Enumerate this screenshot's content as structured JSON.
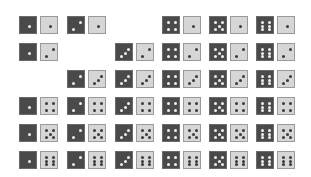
{
  "diagram": {
    "colors": {
      "dark_die": "#4a4a4a",
      "light_die": "#d6d6d6",
      "dark_pip": "#f0f0f0",
      "light_pip": "#3a3a3a"
    },
    "columns_x": [
      19,
      67,
      115,
      162,
      209,
      256
    ],
    "rows_y": [
      16,
      43,
      70,
      97,
      124,
      151
    ],
    "light_offset_x": 21,
    "die_size": 18,
    "pairs": [
      {
        "row": 1,
        "col": 1,
        "dark": 1,
        "light": 1
      },
      {
        "row": 1,
        "col": 2,
        "dark": 2,
        "light": 1
      },
      {
        "row": 1,
        "col": 4,
        "dark": 4,
        "light": 1
      },
      {
        "row": 1,
        "col": 5,
        "dark": 5,
        "light": 1
      },
      {
        "row": 1,
        "col": 6,
        "dark": 6,
        "light": 1
      },
      {
        "row": 2,
        "col": 1,
        "dark": 1,
        "light": 2
      },
      {
        "row": 2,
        "col": 3,
        "dark": 3,
        "light": 2
      },
      {
        "row": 2,
        "col": 4,
        "dark": 4,
        "light": 2
      },
      {
        "row": 2,
        "col": 5,
        "dark": 5,
        "light": 2
      },
      {
        "row": 2,
        "col": 6,
        "dark": 6,
        "light": 2
      },
      {
        "row": 3,
        "col": 2,
        "dark": 2,
        "light": 3
      },
      {
        "row": 3,
        "col": 3,
        "dark": 3,
        "light": 3
      },
      {
        "row": 3,
        "col": 4,
        "dark": 4,
        "light": 3
      },
      {
        "row": 3,
        "col": 5,
        "dark": 5,
        "light": 3
      },
      {
        "row": 3,
        "col": 6,
        "dark": 6,
        "light": 3
      },
      {
        "row": 4,
        "col": 1,
        "dark": 1,
        "light": 4
      },
      {
        "row": 4,
        "col": 2,
        "dark": 2,
        "light": 4
      },
      {
        "row": 4,
        "col": 3,
        "dark": 3,
        "light": 4
      },
      {
        "row": 4,
        "col": 4,
        "dark": 4,
        "light": 4
      },
      {
        "row": 4,
        "col": 5,
        "dark": 5,
        "light": 4
      },
      {
        "row": 4,
        "col": 6,
        "dark": 6,
        "light": 4
      },
      {
        "row": 5,
        "col": 1,
        "dark": 1,
        "light": 5
      },
      {
        "row": 5,
        "col": 2,
        "dark": 2,
        "light": 5
      },
      {
        "row": 5,
        "col": 3,
        "dark": 3,
        "light": 5
      },
      {
        "row": 5,
        "col": 4,
        "dark": 4,
        "light": 5
      },
      {
        "row": 5,
        "col": 5,
        "dark": 5,
        "light": 5
      },
      {
        "row": 5,
        "col": 6,
        "dark": 6,
        "light": 5
      },
      {
        "row": 6,
        "col": 1,
        "dark": 1,
        "light": 6
      },
      {
        "row": 6,
        "col": 2,
        "dark": 2,
        "light": 6
      },
      {
        "row": 6,
        "col": 3,
        "dark": 3,
        "light": 6
      },
      {
        "row": 6,
        "col": 4,
        "dark": 4,
        "light": 6
      },
      {
        "row": 6,
        "col": 5,
        "dark": 5,
        "light": 6
      },
      {
        "row": 6,
        "col": 6,
        "dark": 6,
        "light": 6
      }
    ]
  }
}
